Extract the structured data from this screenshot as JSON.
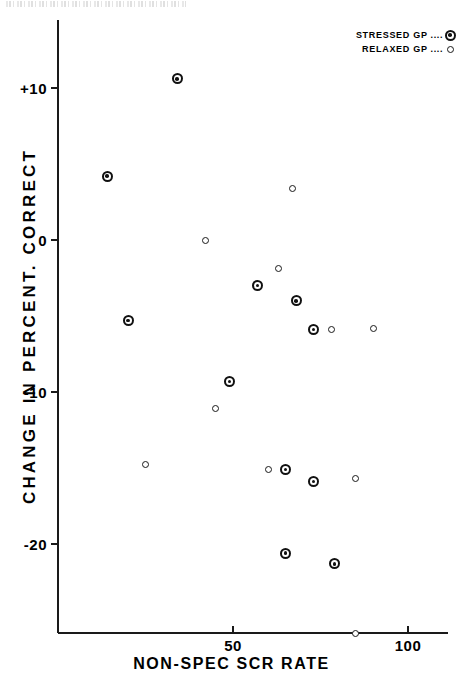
{
  "figure": {
    "scan_artifact_text": "illegible scan header text"
  },
  "legend": {
    "position": "top-right",
    "entries": [
      {
        "label": "STRESSED GP",
        "dots": "....",
        "marker": "bullseye-circle",
        "series_key": "stressed"
      },
      {
        "label": "RELAXED GP",
        "dots": "....",
        "marker": "open-circle",
        "series_key": "relaxed"
      }
    ]
  },
  "axes": {
    "x": {
      "title": "NON-SPEC SCR RATE",
      "ticks": [
        {
          "value": 50,
          "label": "50"
        },
        {
          "value": 100,
          "label": "100"
        }
      ],
      "range": [
        0,
        111
      ]
    },
    "y": {
      "title": "CHANGE IN PERCENT. CORRECT",
      "ticks": [
        {
          "value": 10,
          "label": "+10"
        },
        {
          "value": 0,
          "label": "0"
        },
        {
          "value": -10,
          "label": "-10"
        },
        {
          "value": -20,
          "label": "-20"
        }
      ],
      "range": [
        -27.2,
        13.2
      ]
    }
  },
  "chart_data": {
    "type": "scatter",
    "title": "",
    "xlabel": "NON-SPEC SCR RATE",
    "ylabel": "CHANGE IN PERCENT. CORRECT",
    "xlim": [
      0,
      111
    ],
    "ylim": [
      -27.2,
      13.2
    ],
    "xticks": [
      50,
      100
    ],
    "yticks": [
      10,
      0,
      -10,
      -20
    ],
    "grid": false,
    "legend_position": "top-right",
    "series": [
      {
        "name": "STRESSED GP",
        "marker": "bullseye-circle",
        "color": "#111111",
        "points": [
          {
            "x": 34,
            "y": 10.6
          },
          {
            "x": 14,
            "y": 4.2
          },
          {
            "x": 20,
            "y": -5.3
          },
          {
            "x": 57,
            "y": -3.0
          },
          {
            "x": 49,
            "y": -9.3
          },
          {
            "x": 68,
            "y": -4.0
          },
          {
            "x": 73,
            "y": -5.9
          },
          {
            "x": 65,
            "y": -15.1
          },
          {
            "x": 73,
            "y": -15.9
          },
          {
            "x": 65,
            "y": -20.6
          },
          {
            "x": 79,
            "y": -21.3
          }
        ]
      },
      {
        "name": "RELAXED GP",
        "marker": "open-circle",
        "color": "#1a1a1a",
        "points": [
          {
            "x": 42,
            "y": 0.0
          },
          {
            "x": 67,
            "y": 3.4
          },
          {
            "x": 63,
            "y": -1.9
          },
          {
            "x": 78,
            "y": -5.9
          },
          {
            "x": 90,
            "y": -5.8
          },
          {
            "x": 45,
            "y": -11.1
          },
          {
            "x": 25,
            "y": -14.8
          },
          {
            "x": 60,
            "y": -15.1
          },
          {
            "x": 85,
            "y": -15.7
          },
          {
            "x": 85,
            "y": -25.9
          }
        ]
      }
    ]
  }
}
